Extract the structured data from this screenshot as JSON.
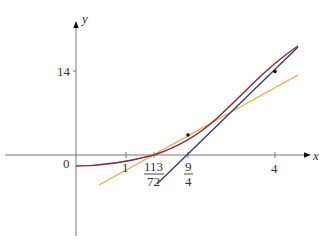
{
  "diagram": {
    "type": "newton-method-plot",
    "axes": {
      "x_label": "x",
      "y_label": "y",
      "origin_label": "0",
      "y_tick_label": "14",
      "x_tick_labels": {
        "one": "1",
        "frac1_num": "113",
        "frac1_den": "72",
        "frac2_num": "9",
        "frac2_den": "4",
        "four": "4"
      }
    },
    "curves": [
      {
        "name": "function-curve",
        "color": "#8b2a3a"
      },
      {
        "name": "tangent-at-x1",
        "color": "#f0a848"
      },
      {
        "name": "tangent-at-x0",
        "color": "#2e3f7a"
      }
    ],
    "points": [
      {
        "name": "point-on-curve-x4",
        "x": 4
      },
      {
        "name": "point-on-curve-x9-4",
        "x": 2.25
      }
    ],
    "colors": {
      "axis": "#777777",
      "curve": "#8b2a3a",
      "tangent_orange": "#f0a848",
      "tangent_blue": "#2e3f7a"
    }
  }
}
